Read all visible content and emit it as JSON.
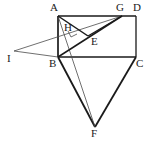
{
  "figure": {
    "width": 152,
    "height": 143,
    "background_color": "#ffffff",
    "stroke_color": "#1a1a1a",
    "thin_stroke_color": "#4a4a4a"
  },
  "points": {
    "A": {
      "label": "A",
      "x": 58,
      "y": 16,
      "label_x": 50,
      "label_y": 2
    },
    "B": {
      "label": "B",
      "x": 58,
      "y": 57,
      "label_x": 50,
      "label_y": 58
    },
    "C": {
      "label": "C",
      "x": 136,
      "y": 57,
      "label_x": 137,
      "label_y": 58
    },
    "D": {
      "label": "D",
      "x": 136,
      "y": 16,
      "label_x": 137,
      "label_y": 2
    },
    "E": {
      "label": "E",
      "x": 88,
      "y": 36,
      "label_x": 91,
      "label_y": 37
    },
    "F": {
      "label": "F",
      "x": 95,
      "y": 127,
      "label_x": 92,
      "label_y": 128
    },
    "G": {
      "label": "G",
      "x": 122,
      "y": 16,
      "label_x": 118,
      "label_y": 2
    },
    "H": {
      "label": "H",
      "x": 72,
      "y": 33,
      "label_x": 66,
      "label_y": 24
    },
    "I": {
      "label": "I",
      "x": 14,
      "y": 51,
      "label_x": 8,
      "label_y": 52
    }
  },
  "segments": [
    {
      "name": "side-AD",
      "from": "A",
      "to": "D",
      "weight": "thick"
    },
    {
      "name": "side-DC",
      "from": "D",
      "to": "C",
      "weight": "thick"
    },
    {
      "name": "side-CB",
      "from": "C",
      "to": "B",
      "weight": "thick"
    },
    {
      "name": "side-BA",
      "from": "B",
      "to": "A",
      "weight": "thick"
    },
    {
      "name": "segment-BF",
      "from": "B",
      "to": "F",
      "weight": "thick"
    },
    {
      "name": "segment-CF",
      "from": "C",
      "to": "F",
      "weight": "thick"
    },
    {
      "name": "segment-AE",
      "from": "A",
      "to": "E",
      "weight": "thick"
    },
    {
      "name": "segment-EG",
      "from": "E",
      "to": "G",
      "weight": "thick"
    },
    {
      "name": "segment-BG",
      "from": "B",
      "to": "G",
      "weight": "thick"
    },
    {
      "name": "segment-AH-to-F",
      "from": "A",
      "to": "F",
      "weight": "thin"
    },
    {
      "name": "segment-IG",
      "from": "I",
      "to": "G",
      "weight": "thin"
    },
    {
      "name": "segment-IB",
      "from": "I",
      "to": "B",
      "weight": "thin"
    },
    {
      "name": "segment-BE-extended",
      "from": "B",
      "to": "E",
      "weight": "thick"
    }
  ],
  "right_angle_marker": {
    "name": "right-angle-at-H",
    "x": 71,
    "y": 34,
    "size": 6,
    "vertex": "H"
  },
  "labels_order": [
    "A",
    "G",
    "D",
    "H",
    "E",
    "I",
    "B",
    "C",
    "F"
  ]
}
